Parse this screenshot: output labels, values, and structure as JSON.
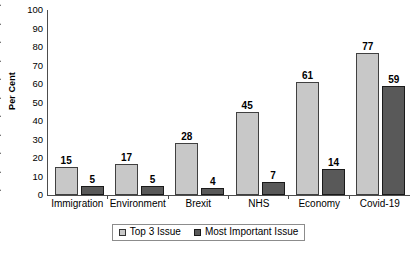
{
  "chart_data": {
    "type": "bar",
    "title": "",
    "subtitle": "",
    "xlabel": "",
    "ylabel": "Per Cent",
    "ylim": [
      0,
      100
    ],
    "ytick_step": 10,
    "yticks": [
      100,
      90,
      80,
      70,
      60,
      50,
      40,
      30,
      20,
      10,
      0
    ],
    "grid": false,
    "legend_position": "bottom-center",
    "data_labels": true,
    "categories": [
      "Immigration",
      "Environment",
      "Brexit",
      "NHS",
      "Economy",
      "Covid-19"
    ],
    "series": [
      {
        "name": "Top 3 Issue",
        "color": "#c8c8c8",
        "values": [
          15,
          17,
          28,
          45,
          61,
          77
        ]
      },
      {
        "name": "Most Important Issue",
        "color": "#595959",
        "values": [
          5,
          5,
          4,
          7,
          14,
          59
        ]
      }
    ]
  },
  "axis": {
    "y_title": "Per Cent",
    "y_tick_labels": [
      "100",
      "90",
      "80",
      "70",
      "60",
      "50",
      "40",
      "30",
      "20",
      "10",
      "0"
    ],
    "x_tick_labels": [
      "Immigration",
      "Environment",
      "Brexit",
      "NHS",
      "Economy",
      "Covid-19"
    ]
  },
  "legend": {
    "items": [
      {
        "label": "Top 3 Issue",
        "swatch": "series-a"
      },
      {
        "label": "Most Important Issue",
        "swatch": "series-b"
      }
    ]
  },
  "bar_labels": {
    "series_a": [
      "15",
      "17",
      "28",
      "45",
      "61",
      "77"
    ],
    "series_b": [
      "5",
      "5",
      "4",
      "7",
      "14",
      "59"
    ]
  },
  "colors": {
    "series_a": "#c8c8c8",
    "series_b": "#595959",
    "axis": "#4d4d4d",
    "text": "#000000",
    "background": "#ffffff"
  }
}
